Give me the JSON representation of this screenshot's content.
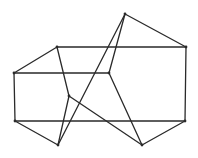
{
  "diagram": {
    "type": "graph",
    "vertices": [
      {
        "id": "T",
        "x": 125,
        "y": 14
      },
      {
        "id": "A",
        "x": 57,
        "y": 47
      },
      {
        "id": "R",
        "x": 186,
        "y": 47
      },
      {
        "id": "L",
        "x": 14,
        "y": 73
      },
      {
        "id": "M",
        "x": 109,
        "y": 73
      },
      {
        "id": "P",
        "x": 69,
        "y": 96
      },
      {
        "id": "BL",
        "x": 15,
        "y": 121
      },
      {
        "id": "BR",
        "x": 185,
        "y": 121
      },
      {
        "id": "Q",
        "x": 58,
        "y": 145
      },
      {
        "id": "S",
        "x": 142,
        "y": 145
      }
    ],
    "edges": [
      [
        "A",
        "R"
      ],
      [
        "R",
        "BR"
      ],
      [
        "L",
        "M"
      ],
      [
        "L",
        "BL"
      ],
      [
        "BL",
        "BR"
      ],
      [
        "A",
        "L"
      ],
      [
        "T",
        "R"
      ],
      [
        "T",
        "M"
      ],
      [
        "T",
        "Q"
      ],
      [
        "A",
        "P"
      ],
      [
        "P",
        "Q"
      ],
      [
        "P",
        "S"
      ],
      [
        "M",
        "S"
      ],
      [
        "BL",
        "Q"
      ],
      [
        "S",
        "BR"
      ]
    ]
  }
}
